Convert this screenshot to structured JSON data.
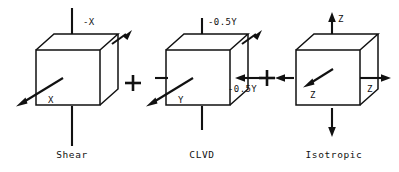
{
  "figure": {
    "background_color": "#ffffff",
    "ink_color": "#111111",
    "operators": [
      {
        "symbol": "+",
        "name": "plus-operator-1"
      },
      {
        "symbol": "+",
        "name": "plus-operator-2"
      }
    ]
  },
  "panels": [
    {
      "id": "shear",
      "caption": "Shear",
      "labels": {
        "top": "-X",
        "diagonal": "X",
        "right": "",
        "bottom": ""
      },
      "arrows": [
        {
          "name": "top-arrow-inward",
          "direction": "down",
          "tip": "arrowhead",
          "label": "-X"
        },
        {
          "name": "bottom-arrow-plain",
          "direction": "down",
          "tip": "none",
          "label": ""
        },
        {
          "name": "diagonal-arrow-lower-left",
          "direction": "down-left",
          "tip": "arrowhead",
          "label": "X"
        },
        {
          "name": "diagonal-arrow-upper-right",
          "direction": "up-right",
          "tip": "arrowhead",
          "label": ""
        }
      ]
    },
    {
      "id": "clvd",
      "caption": "CLVD",
      "labels": {
        "top": "-0.5Y",
        "diagonal": "Y",
        "right": "-0.5Y",
        "bottom": ""
      },
      "arrows": [
        {
          "name": "top-arrow-inward",
          "direction": "down",
          "tip": "arrowhead",
          "label": "-0.5Y"
        },
        {
          "name": "bottom-arrow-plain",
          "direction": "down",
          "tip": "none",
          "label": ""
        },
        {
          "name": "left-tick-plain",
          "direction": "right",
          "tip": "none",
          "label": ""
        },
        {
          "name": "right-arrow-inward",
          "direction": "left",
          "tip": "arrowhead",
          "label": "-0.5Y"
        },
        {
          "name": "diagonal-arrow-lower-left",
          "direction": "down-left",
          "tip": "arrowhead",
          "label": "Y"
        },
        {
          "name": "diagonal-arrow-upper-right",
          "direction": "up-right",
          "tip": "arrowhead",
          "label": ""
        }
      ]
    },
    {
      "id": "isotropic",
      "caption": "Isotropic",
      "labels": {
        "top": "Z",
        "diagonal": "Z",
        "right": "Z",
        "bottom": ""
      },
      "arrows": [
        {
          "name": "top-arrow-outward",
          "direction": "up",
          "tip": "arrowhead",
          "label": "Z"
        },
        {
          "name": "bottom-arrow-outward",
          "direction": "down",
          "tip": "arrowhead",
          "label": ""
        },
        {
          "name": "left-arrow-outward",
          "direction": "left",
          "tip": "arrowhead",
          "label": ""
        },
        {
          "name": "right-arrow-outward",
          "direction": "right",
          "tip": "arrowhead",
          "label": "Z"
        },
        {
          "name": "diagonal-arrow-lower-left",
          "direction": "down-left",
          "tip": "arrowhead",
          "label": "Z"
        }
      ]
    }
  ]
}
